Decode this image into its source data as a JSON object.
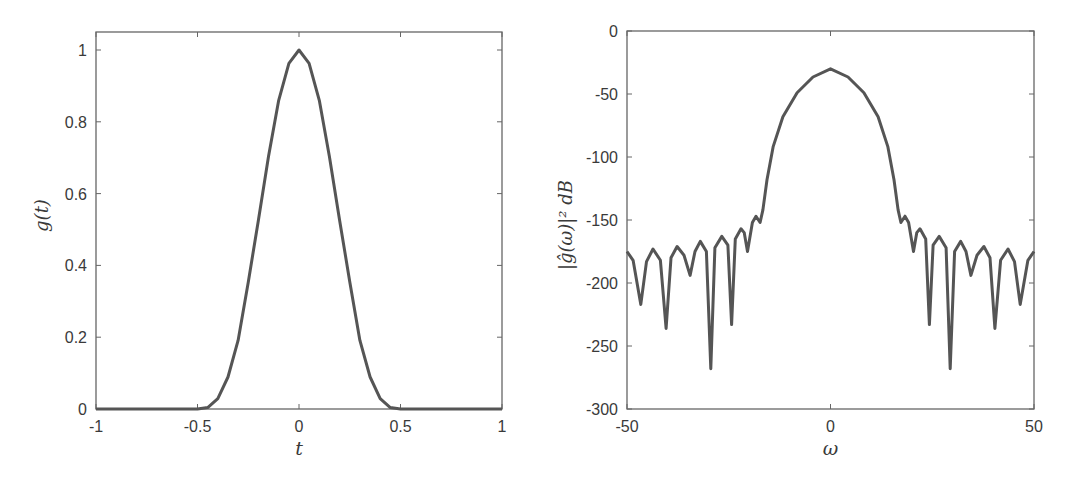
{
  "figure": {
    "style": {
      "line_color": "#555555",
      "axis_color": "#666666",
      "text_color": "#3a3a3a",
      "background": "#ffffff"
    }
  },
  "chart_data": [
    {
      "id": "left",
      "type": "line",
      "title": "",
      "xlabel": "t",
      "ylabel": "g(t)",
      "xlim": [
        -1,
        1
      ],
      "ylim": [
        0,
        1.05
      ],
      "grid": false,
      "legend": null,
      "xticks": [
        -1,
        -0.5,
        0,
        0.5,
        1
      ],
      "xtick_labels": [
        "-1",
        "-0.5",
        "0",
        "0.5",
        "1"
      ],
      "yticks": [
        0,
        0.2,
        0.4,
        0.6,
        0.8,
        1
      ],
      "ytick_labels": [
        "0",
        "0.2",
        "0.4",
        "0.6",
        "0.8",
        "1"
      ],
      "series": [
        {
          "name": "g(t)",
          "x": [
            -1,
            -0.5,
            -0.45,
            -0.4,
            -0.35,
            -0.3,
            -0.25,
            -0.2,
            -0.15,
            -0.1,
            -0.05,
            0,
            0.05,
            0.1,
            0.15,
            0.2,
            0.25,
            0.3,
            0.35,
            0.4,
            0.45,
            0.5,
            1
          ],
          "y": [
            0,
            0,
            0.004,
            0.029,
            0.089,
            0.191,
            0.354,
            0.526,
            0.703,
            0.86,
            0.963,
            1,
            0.963,
            0.86,
            0.703,
            0.526,
            0.354,
            0.191,
            0.089,
            0.029,
            0.004,
            0,
            0
          ]
        }
      ]
    },
    {
      "id": "right",
      "type": "line",
      "title": "",
      "xlabel": "ω",
      "ylabel": "|ĝ(ω)|² dB",
      "xlim": [
        -50,
        50
      ],
      "ylim": [
        -300,
        0
      ],
      "grid": false,
      "legend": null,
      "xticks": [
        -50,
        0,
        50
      ],
      "xtick_labels": [
        "-50",
        "0",
        "50"
      ],
      "yticks": [
        0,
        -50,
        -100,
        -150,
        -200,
        -250,
        -300
      ],
      "ytick_labels": [
        "0",
        "-50",
        "-100",
        "-150",
        "-200",
        "-250",
        "-300"
      ],
      "series": [
        {
          "name": "|ĝ(ω)|² dB",
          "x": [
            -50,
            -48.5,
            -46.6,
            -45.2,
            -43.6,
            -41.8,
            -40.4,
            -39.2,
            -37.7,
            -36,
            -34.5,
            -33.3,
            -32,
            -30.5,
            -29.4,
            -28.4,
            -26.7,
            -25.2,
            -24.3,
            -23.4,
            -22,
            -21.2,
            -20.4,
            -19.2,
            -18.3,
            -17.3,
            -16.6,
            -15.6,
            -14.1,
            -11.7,
            -8.2,
            -4.3,
            0,
            4.3,
            8.2,
            11.7,
            14.1,
            15.6,
            16.6,
            17.3,
            18.3,
            19.2,
            20.4,
            21.2,
            22,
            23.4,
            24.3,
            25.2,
            26.7,
            28.4,
            29.4,
            30.5,
            32,
            33.3,
            34.5,
            36,
            37.7,
            39.2,
            40.4,
            41.8,
            43.6,
            45.2,
            46.6,
            48.5,
            50
          ],
          "y": [
            -175,
            -182,
            -217,
            -183,
            -173,
            -182,
            -236,
            -180,
            -171,
            -178,
            -194,
            -175,
            -167,
            -175,
            -268,
            -172,
            -163,
            -170,
            -233,
            -165,
            -157,
            -160,
            -175,
            -152,
            -147,
            -152,
            -142,
            -118,
            -92,
            -68,
            -49,
            -36.5,
            -30,
            -36.5,
            -49,
            -68,
            -92,
            -118,
            -142,
            -152,
            -147,
            -152,
            -175,
            -160,
            -157,
            -165,
            -233,
            -170,
            -163,
            -172,
            -268,
            -175,
            -167,
            -175,
            -194,
            -178,
            -171,
            -180,
            -236,
            -182,
            -173,
            -183,
            -217,
            -182,
            -175
          ]
        }
      ]
    }
  ]
}
